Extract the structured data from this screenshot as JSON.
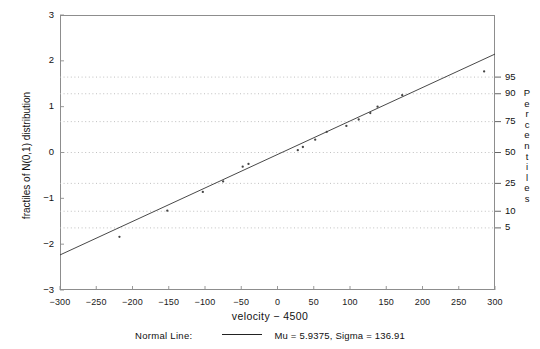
{
  "chart_data": {
    "type": "scatter",
    "title": "",
    "xlabel": "velocity  −  4500",
    "ylabel": "fractiles of N(0,1) distribution",
    "right_axis_label": "Percentiles",
    "xlim": [
      -300,
      300
    ],
    "ylim": [
      -3,
      3
    ],
    "xticks": [
      -300,
      -250,
      -200,
      -150,
      -100,
      -50,
      0,
      50,
      100,
      150,
      200,
      250,
      300
    ],
    "xticklabels": [
      "−300",
      "−250",
      "−200",
      "−150",
      "−100",
      "−50",
      "0",
      "50",
      "100",
      "150",
      "200",
      "250",
      "300"
    ],
    "yticks": [
      -3,
      -2,
      -1,
      0,
      1,
      2,
      3
    ],
    "yticklabels": [
      "−3",
      "−2",
      "−1",
      "0",
      "1",
      "2",
      "3"
    ],
    "percentile_ticks": [
      {
        "label": "95",
        "z": 1.645
      },
      {
        "label": "90",
        "z": 1.282
      },
      {
        "label": "75",
        "z": 0.674
      },
      {
        "label": "50",
        "z": 0.0
      },
      {
        "label": "25",
        "z": -0.674
      },
      {
        "label": "10",
        "z": -1.282
      },
      {
        "label": "5",
        "z": -1.645
      }
    ],
    "gridlines_z": [
      1.645,
      1.282,
      0.674,
      0.0,
      -0.674,
      -1.282,
      -1.645
    ],
    "grid": "horizontal-dotted",
    "legend_position": "below-axis",
    "series": [
      {
        "name": "sample fractiles",
        "marker": "dot",
        "x": [
          -218,
          -152,
          -103,
          -75,
          -48,
          -40,
          28,
          35,
          52,
          68,
          95,
          112,
          128,
          138,
          172,
          285
        ],
        "y": [
          -1.84,
          -1.27,
          -0.86,
          -0.63,
          -0.31,
          -0.25,
          0.05,
          0.12,
          0.28,
          0.45,
          0.58,
          0.72,
          0.86,
          1.0,
          1.25,
          1.77
        ]
      },
      {
        "name": "Normal Line",
        "type": "line",
        "mu": 5.9375,
        "sigma": 136.91,
        "x_endpoints": [
          -300,
          300
        ],
        "y_endpoints": [
          -2.235,
          2.148
        ]
      }
    ]
  },
  "legend": {
    "title": "Normal Line:",
    "params": "Mu = 5.9375,  Sigma = 136.91"
  },
  "colors": {
    "frame": "#8d8d8d",
    "grid": "#b9b9b9",
    "line": "#333333",
    "marker": "#444444",
    "text": "#111111"
  }
}
